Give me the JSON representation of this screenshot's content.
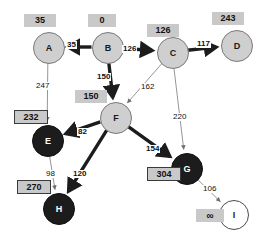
{
  "diagram": {
    "colors": {
      "node_gray": "#cfcfcf",
      "node_black": "#1c1c1c",
      "node_white": "#ffffff",
      "dist_box": "#c9c9c9",
      "edge_bold": "#1c1c1c",
      "edge_thin": "#8a8a8a"
    },
    "nodes": [
      {
        "id": "A",
        "label": "A",
        "x": 48,
        "y": 47,
        "r": 15,
        "fill": "gray",
        "dist": "35",
        "dist_x": 24,
        "dist_y": 14,
        "dist_boxed": false
      },
      {
        "id": "B",
        "label": "B",
        "x": 107,
        "y": 47,
        "r": 15,
        "fill": "gray",
        "dist": "0",
        "dist_x": 88,
        "dist_y": 14,
        "dist_boxed": false
      },
      {
        "id": "C",
        "label": "C",
        "x": 172,
        "y": 52,
        "r": 15,
        "fill": "gray",
        "dist": "126",
        "dist_x": 147,
        "dist_y": 24,
        "dist_boxed": false
      },
      {
        "id": "D",
        "label": "D",
        "x": 236,
        "y": 45,
        "r": 15,
        "fill": "gray",
        "dist": "243",
        "dist_x": 212,
        "dist_y": 12,
        "dist_boxed": false
      },
      {
        "id": "E",
        "label": "E",
        "x": 47,
        "y": 140,
        "r": 15,
        "fill": "black",
        "dist": "232",
        "dist_x": 14,
        "dist_y": 110,
        "dist_boxed": true
      },
      {
        "id": "F",
        "label": "F",
        "x": 115,
        "y": 117,
        "r": 15,
        "fill": "gray",
        "dist": "150",
        "dist_x": 75,
        "dist_y": 90,
        "dist_boxed": false
      },
      {
        "id": "G",
        "label": "G",
        "x": 186,
        "y": 168,
        "r": 15,
        "fill": "black",
        "dist": "304",
        "dist_x": 147,
        "dist_y": 167,
        "dist_boxed": true
      },
      {
        "id": "H",
        "label": "H",
        "x": 58,
        "y": 208,
        "r": 15,
        "fill": "black",
        "dist": "270",
        "dist_x": 17,
        "dist_y": 180,
        "dist_boxed": true
      },
      {
        "id": "I",
        "label": "I",
        "x": 233,
        "y": 214,
        "r": 14,
        "fill": "white",
        "dist": "∞",
        "dist_x": 196,
        "dist_y": 209,
        "dist_boxed": false
      }
    ],
    "edges": [
      {
        "from": "B",
        "to": "A",
        "weight": "35",
        "bold": true,
        "lx": 66,
        "ly": 41
      },
      {
        "from": "B",
        "to": "C",
        "weight": "126",
        "bold": true,
        "lx": 122,
        "ly": 45
      },
      {
        "from": "C",
        "to": "D",
        "weight": "117",
        "bold": true,
        "lx": 196,
        "ly": 40
      },
      {
        "from": "B",
        "to": "F",
        "weight": "150",
        "bold": true,
        "lx": 96,
        "ly": 73
      },
      {
        "from": "A",
        "to": "E",
        "weight": "247",
        "bold": false,
        "lx": 35,
        "ly": 82
      },
      {
        "from": "C",
        "to": "F",
        "weight": "162",
        "bold": false,
        "lx": 140,
        "ly": 83
      },
      {
        "from": "C",
        "to": "G",
        "weight": "220",
        "bold": false,
        "lx": 172,
        "ly": 113
      },
      {
        "from": "F",
        "to": "E",
        "weight": "82",
        "bold": true,
        "lx": 77,
        "ly": 128
      },
      {
        "from": "F",
        "to": "G",
        "weight": "154",
        "bold": true,
        "lx": 145,
        "ly": 145
      },
      {
        "from": "F",
        "to": "H",
        "weight": "120",
        "bold": true,
        "lx": 72,
        "ly": 170
      },
      {
        "from": "E",
        "to": "H",
        "weight": "98",
        "bold": false,
        "lx": 45,
        "ly": 170
      },
      {
        "from": "G",
        "to": "I",
        "weight": "106",
        "bold": false,
        "lx": 202,
        "ly": 185
      }
    ]
  }
}
